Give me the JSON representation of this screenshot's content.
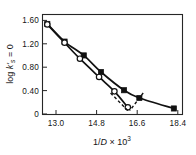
{
  "chart_data": {
    "type": "line",
    "title": "",
    "subtitle": "",
    "xlabel": "1/D × 10³",
    "xlabel_parts": {
      "prefix": "1/",
      "italic": "D",
      "suffix": " × 10",
      "exponent": "3"
    },
    "ylabel": "log k'ₛ₌₀",
    "ylabel_parts": {
      "prefix": "log ",
      "italic": "k'",
      "subscript": "s",
      "suffix": " = 0"
    },
    "xlim": [
      12.3,
      19.6
    ],
    "ylim": [
      -0.08,
      1.72
    ],
    "xticks": [
      13.0,
      14.8,
      16.6,
      18.4
    ],
    "xtick_labels": [
      "13.0",
      "14.8",
      "16.6",
      "18.4"
    ],
    "yticks": [
      0,
      0.4,
      0.8,
      1.2,
      1.6
    ],
    "ytick_labels": [
      "0",
      "0.40",
      "0.80",
      "1.20",
      "1.60"
    ],
    "grid": false,
    "legend": "none",
    "frame": "box",
    "series": [
      {
        "name": "filled-square-series",
        "marker": "filled-square",
        "linestyle": "solid",
        "color": "#111111",
        "x": [
          12.55,
          13.45,
          14.45,
          15.35,
          16.55,
          17.35,
          19.15
        ],
        "y": [
          1.55,
          1.23,
          0.98,
          0.68,
          0.35,
          0.21,
          0.02
        ]
      },
      {
        "name": "open-circle-series",
        "marker": "open-circle",
        "linestyle": "solid",
        "color": "#111111",
        "x": [
          12.55,
          13.45,
          14.25,
          15.25,
          16.05,
          16.75
        ],
        "y": [
          1.54,
          1.21,
          0.92,
          0.59,
          0.33,
          0.04
        ]
      }
    ],
    "annotations": [
      {
        "name": "extrapolation-dashed-left",
        "style": "dashed",
        "x": [
          15.85,
          16.75
        ],
        "y": [
          0.3,
          -0.02
        ]
      },
      {
        "name": "extrapolation-dashed-right",
        "style": "dashed",
        "x": [
          17.55,
          16.85
        ],
        "y": [
          0.3,
          -0.02
        ]
      }
    ]
  }
}
